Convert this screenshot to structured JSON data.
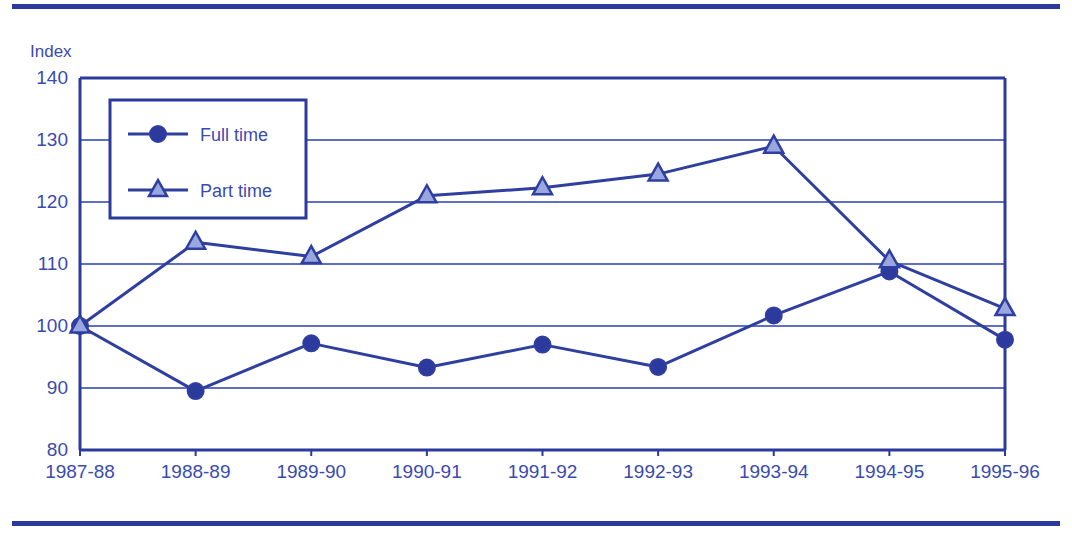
{
  "figure": {
    "y_axis_title": "Index",
    "top_rule": "decorative-rule",
    "bottom_rule": "decorative-rule"
  },
  "colors": {
    "line": "#2f3fa0",
    "grid": "#5f6fc4",
    "axis": "#2b3a9c",
    "marker_fill_full": "#2b3a9c",
    "marker_fill_part": "#9aa6e0",
    "text": "#3a4bb0",
    "rule": "#2b3a9c"
  },
  "chart_data": {
    "type": "line",
    "title": "",
    "xlabel": "",
    "ylabel": "Index",
    "ylim": [
      80,
      140
    ],
    "ytick_step": 10,
    "yticks": [
      80,
      90,
      100,
      110,
      120,
      130,
      140
    ],
    "grid": true,
    "legend_position": "upper-left-inside",
    "categories": [
      "1987-88",
      "1988-89",
      "1989-90",
      "1990-91",
      "1991-92",
      "1992-93",
      "1993-94",
      "1994-95",
      "1995-96"
    ],
    "series": [
      {
        "name": "Full time",
        "marker": "circle",
        "values": [
          100.0,
          89.5,
          97.2,
          93.3,
          97.0,
          93.4,
          101.7,
          108.8,
          97.8
        ]
      },
      {
        "name": "Part time",
        "marker": "triangle",
        "values": [
          100.0,
          113.5,
          111.2,
          121.0,
          122.3,
          124.5,
          129.0,
          110.5,
          102.8
        ]
      }
    ]
  },
  "legend": {
    "items": [
      {
        "label": "Full time",
        "marker": "circle"
      },
      {
        "label": "Part time",
        "marker": "triangle"
      }
    ]
  }
}
